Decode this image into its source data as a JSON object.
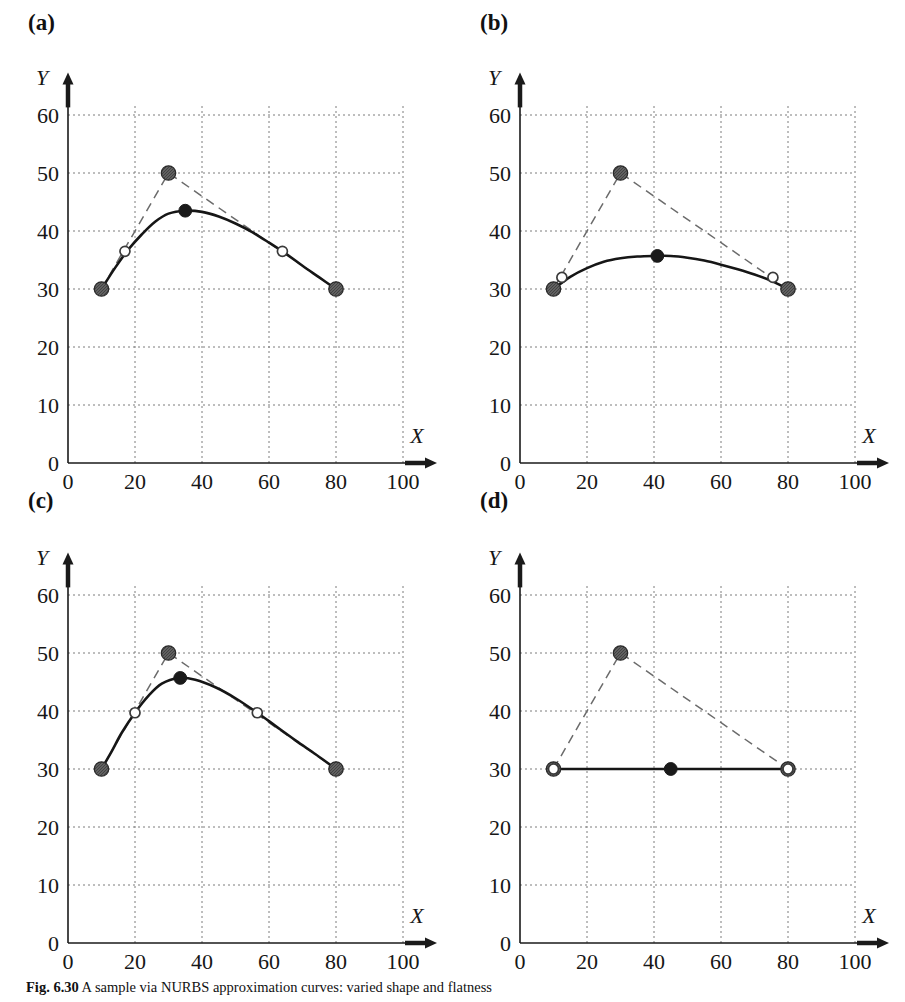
{
  "figure": {
    "caption_label": "Fig. 6.30",
    "caption_text": "A sample via NURBS approximation curves: varied shape and flatness"
  },
  "axes": {
    "x_name": "X",
    "y_name": "Y",
    "x_ticks": [
      "0",
      "20",
      "40",
      "60",
      "80",
      "100"
    ],
    "y_ticks": [
      "0",
      "10",
      "20",
      "30",
      "40",
      "50",
      "60"
    ],
    "x_tick_values": [
      0,
      20,
      40,
      60,
      80,
      100
    ],
    "y_tick_values": [
      0,
      10,
      20,
      30,
      40,
      50,
      60
    ],
    "xlim": [
      0,
      100
    ],
    "ylim": [
      0,
      62
    ],
    "grid": "dotted"
  },
  "colors": {
    "axis": "#1a1a1a",
    "grid": "#7d7d7d",
    "control_polygon": "#6b6b6b",
    "fit_curve": "#161616",
    "control_point_fill": "#6e6e6e",
    "control_point_edge": "#2a2a2a",
    "interpolated_point_fill": "#1a1a1a",
    "open_point_fill": "#ffffff",
    "open_point_edge": "#3a3a3a"
  },
  "legend_semantics": {
    "control_polygon": "dashed polyline through control points",
    "fit_curve": "solid approximation curve",
    "control_point": "hatched gray circle marker",
    "peak_point": "filled black circle marker",
    "knot_point": "open (hollow) circle marker"
  },
  "chart_data": [
    {
      "type": "line",
      "panel": "(a)",
      "title": "(a)",
      "xlabel": "X",
      "ylabel": "Y",
      "xlim": [
        0,
        100
      ],
      "ylim": [
        0,
        62
      ],
      "grid": true,
      "series": [
        {
          "name": "control polygon",
          "style": "dashed",
          "marker": "hatched-circle",
          "x": [
            10,
            30,
            80
          ],
          "y": [
            30,
            50,
            30
          ]
        },
        {
          "name": "approximation curve",
          "style": "solid",
          "marker": "none",
          "x": [
            10,
            14,
            18,
            22,
            26,
            30,
            35,
            40,
            45,
            50,
            55,
            60,
            65,
            70,
            75,
            80
          ],
          "y": [
            30.0,
            33.6,
            36.8,
            39.4,
            41.6,
            43.0,
            43.5,
            43.3,
            42.5,
            41.3,
            39.8,
            38.0,
            36.1,
            34.0,
            32.0,
            30.0
          ]
        },
        {
          "name": "peak point",
          "style": "point",
          "marker": "filled-circle",
          "x": [
            35
          ],
          "y": [
            43.5
          ]
        },
        {
          "name": "knot points",
          "style": "point",
          "marker": "open-circle",
          "x": [
            17,
            64
          ],
          "y": [
            36.5,
            36.5
          ]
        }
      ]
    },
    {
      "type": "line",
      "panel": "(b)",
      "title": "(b)",
      "xlabel": "X",
      "ylabel": "Y",
      "xlim": [
        0,
        100
      ],
      "ylim": [
        0,
        62
      ],
      "grid": true,
      "series": [
        {
          "name": "control polygon",
          "style": "dashed",
          "marker": "hatched-circle",
          "x": [
            10,
            30,
            80
          ],
          "y": [
            30,
            50,
            30
          ]
        },
        {
          "name": "approximation curve",
          "style": "solid",
          "marker": "none",
          "x": [
            10,
            15,
            20,
            25,
            30,
            35,
            40,
            45,
            50,
            55,
            60,
            65,
            70,
            75,
            80
          ],
          "y": [
            30.0,
            32.1,
            33.6,
            34.7,
            35.3,
            35.6,
            35.7,
            35.7,
            35.4,
            34.9,
            34.2,
            33.4,
            32.5,
            31.4,
            30.0
          ]
        },
        {
          "name": "peak point",
          "style": "point",
          "marker": "filled-circle",
          "x": [
            41
          ],
          "y": [
            35.7
          ]
        },
        {
          "name": "knot points",
          "style": "point",
          "marker": "open-circle",
          "x": [
            12.5,
            75.5
          ],
          "y": [
            32.0,
            32.0
          ]
        }
      ]
    },
    {
      "type": "line",
      "panel": "(c)",
      "title": "(c)",
      "xlabel": "X",
      "ylabel": "Y",
      "xlim": [
        0,
        100
      ],
      "ylim": [
        0,
        62
      ],
      "grid": true,
      "series": [
        {
          "name": "control polygon",
          "style": "dashed",
          "marker": "hatched-circle",
          "x": [
            10,
            30,
            80
          ],
          "y": [
            30,
            50,
            30
          ]
        },
        {
          "name": "approximation curve",
          "style": "solid",
          "marker": "none",
          "x": [
            10,
            13,
            16,
            20,
            24,
            28,
            33,
            38,
            44,
            50,
            56.5,
            62,
            68,
            74,
            80
          ],
          "y": [
            30.0,
            33.0,
            36.2,
            39.7,
            42.6,
            44.7,
            45.7,
            45.4,
            44.1,
            42.2,
            39.7,
            37.4,
            34.9,
            32.5,
            30.0
          ]
        },
        {
          "name": "peak point",
          "style": "point",
          "marker": "filled-circle",
          "x": [
            33.5
          ],
          "y": [
            45.7
          ]
        },
        {
          "name": "knot points",
          "style": "point",
          "marker": "open-circle",
          "x": [
            20,
            56.5
          ],
          "y": [
            39.7,
            39.7
          ]
        }
      ]
    },
    {
      "type": "line",
      "panel": "(d)",
      "title": "(d)",
      "xlabel": "X",
      "ylabel": "Y",
      "xlim": [
        0,
        100
      ],
      "ylim": [
        0,
        62
      ],
      "grid": true,
      "series": [
        {
          "name": "control polygon",
          "style": "dashed",
          "marker": "hatched-circle",
          "x": [
            10,
            30,
            80
          ],
          "y": [
            30,
            50,
            30
          ]
        },
        {
          "name": "approximation curve",
          "style": "solid",
          "marker": "none",
          "x": [
            10,
            80
          ],
          "y": [
            30.0,
            30.0
          ]
        },
        {
          "name": "peak point",
          "style": "point",
          "marker": "filled-circle",
          "x": [
            45
          ],
          "y": [
            30.0
          ]
        },
        {
          "name": "knot points",
          "style": "point",
          "marker": "open-circle",
          "x": [
            10,
            80
          ],
          "y": [
            30.0,
            30.0
          ]
        }
      ]
    }
  ]
}
